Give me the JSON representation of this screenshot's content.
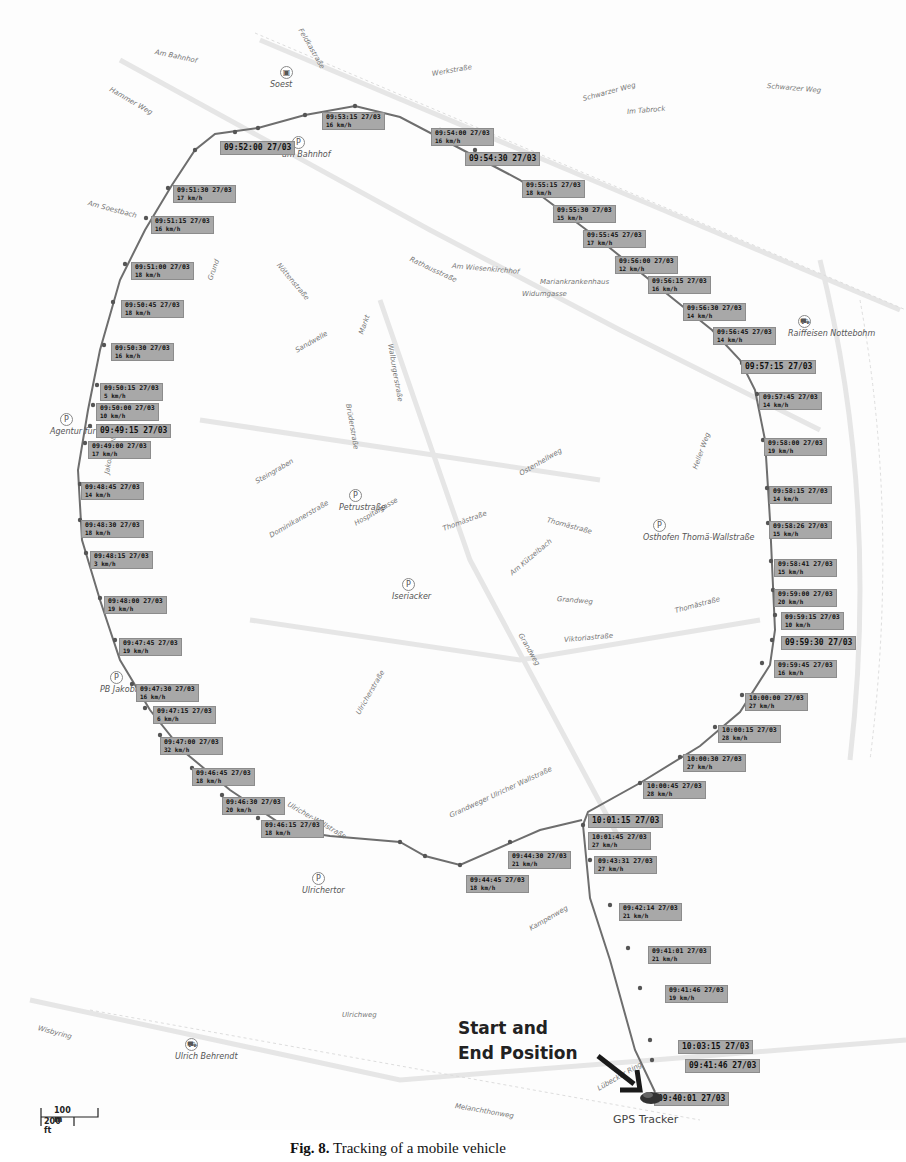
{
  "map": {
    "pois": [
      {
        "name": "Soest",
        "x": 280,
        "y": 80,
        "type": "station"
      },
      {
        "name": "am Bahnhof",
        "x": 292,
        "y": 150,
        "type": "parking"
      },
      {
        "name": "Agentur für Arbeit",
        "x": 60,
        "y": 427,
        "type": "parking"
      },
      {
        "name": "Petrustraße",
        "x": 349,
        "y": 503,
        "type": "parking"
      },
      {
        "name": "Iseriacker",
        "x": 402,
        "y": 592,
        "type": "parking"
      },
      {
        "name": "Raiffeisen Nottebohm",
        "x": 798,
        "y": 329,
        "type": "shop"
      },
      {
        "name": "Osthofen Thomä-Wallstraße",
        "x": 653,
        "y": 533,
        "type": "parking"
      },
      {
        "name": "PB Jakobi",
        "x": 110,
        "y": 685,
        "type": "parking"
      },
      {
        "name": "Ulrichertor",
        "x": 312,
        "y": 886,
        "type": "parking"
      },
      {
        "name": "Ulrich Behrendt",
        "x": 185,
        "y": 1052,
        "type": "shop"
      }
    ],
    "streets": [
      {
        "name": "Am Bahnhof",
        "x": 155,
        "y": 48,
        "r": 12
      },
      {
        "name": "Hammer Weg",
        "x": 110,
        "y": 85,
        "r": 30
      },
      {
        "name": "Feldkastraße",
        "x": 300,
        "y": 25,
        "r": 60
      },
      {
        "name": "Werkstraße",
        "x": 432,
        "y": 70,
        "r": -10
      },
      {
        "name": "Schwarzer Weg",
        "x": 583,
        "y": 95,
        "r": -15
      },
      {
        "name": "Im Tabrock",
        "x": 627,
        "y": 108,
        "r": -5
      },
      {
        "name": "Schwarzer Weg",
        "x": 767,
        "y": 82,
        "r": 5
      },
      {
        "name": "Am Soestbach",
        "x": 88,
        "y": 199,
        "r": 15
      },
      {
        "name": "Grund",
        "x": 210,
        "y": 276,
        "r": -70
      },
      {
        "name": "Nöttenstraße",
        "x": 278,
        "y": 260,
        "r": 50
      },
      {
        "name": "Rathausstraße",
        "x": 410,
        "y": 255,
        "r": 25
      },
      {
        "name": "Am Wiesenkirchhof",
        "x": 452,
        "y": 262,
        "r": 5
      },
      {
        "name": "Mariankrankenhaus",
        "x": 540,
        "y": 278,
        "r": 0
      },
      {
        "name": "Widumgasse",
        "x": 522,
        "y": 290,
        "r": 0
      },
      {
        "name": "Sandwelle",
        "x": 296,
        "y": 347,
        "r": -30
      },
      {
        "name": "Markt",
        "x": 361,
        "y": 330,
        "r": -70
      },
      {
        "name": "Walburgerstraße",
        "x": 390,
        "y": 340,
        "r": 80
      },
      {
        "name": "Brüderstraße",
        "x": 348,
        "y": 400,
        "r": 80
      },
      {
        "name": "Jakobistraße",
        "x": 107,
        "y": 470,
        "r": -80
      },
      {
        "name": "Steingraben",
        "x": 256,
        "y": 478,
        "r": -30
      },
      {
        "name": "Dominikanerstraße",
        "x": 270,
        "y": 532,
        "r": -30
      },
      {
        "name": "Hospitalgasse",
        "x": 355,
        "y": 520,
        "r": -30
      },
      {
        "name": "Thomästraße",
        "x": 443,
        "y": 525,
        "r": -20
      },
      {
        "name": "Thomästraße",
        "x": 547,
        "y": 516,
        "r": 15
      },
      {
        "name": "Ostenhellweg",
        "x": 520,
        "y": 470,
        "r": -30
      },
      {
        "name": "Am Kützelbach",
        "x": 511,
        "y": 570,
        "r": -40
      },
      {
        "name": "Heller Weg",
        "x": 695,
        "y": 465,
        "r": -70
      },
      {
        "name": "Grandweg",
        "x": 557,
        "y": 595,
        "r": 5
      },
      {
        "name": "Grandweg",
        "x": 520,
        "y": 630,
        "r": 60
      },
      {
        "name": "Thomästraße",
        "x": 675,
        "y": 607,
        "r": -15
      },
      {
        "name": "Viktoriastraße",
        "x": 564,
        "y": 636,
        "r": -5
      },
      {
        "name": "Ulricherstraße",
        "x": 358,
        "y": 710,
        "r": -60
      },
      {
        "name": "Ulricher-Wallstraße",
        "x": 288,
        "y": 800,
        "r": 30
      },
      {
        "name": "Grandweger Ulricher Wallstraße",
        "x": 450,
        "y": 812,
        "r": -25
      },
      {
        "name": "Wisbyring",
        "x": 38,
        "y": 1024,
        "r": 15
      },
      {
        "name": "Ulrichweg",
        "x": 342,
        "y": 1011,
        "r": 0
      },
      {
        "name": "Kampenweg",
        "x": 530,
        "y": 925,
        "r": -30
      },
      {
        "name": "Melanchthonweg",
        "x": 455,
        "y": 1102,
        "r": 10
      },
      {
        "name": "Lübecker Ring",
        "x": 598,
        "y": 1085,
        "r": -30
      }
    ],
    "track_labels": [
      {
        "time": "09:53:15 27/03",
        "speed": "16 km/h",
        "x": 322,
        "y": 112
      },
      {
        "time": "09:52:00 27/03",
        "speed": "",
        "x": 220,
        "y": 141
      },
      {
        "time": "09:54:00 27/03",
        "speed": "16 km/h",
        "x": 431,
        "y": 128
      },
      {
        "time": "09:54:30 27/03",
        "speed": "",
        "x": 465,
        "y": 152
      },
      {
        "time": "09:55:15 27/03",
        "speed": "18 km/h",
        "x": 522,
        "y": 180
      },
      {
        "time": "09:55:30 27/03",
        "speed": "15 km/h",
        "x": 553,
        "y": 205
      },
      {
        "time": "09:55:45 27/03",
        "speed": "17 km/h",
        "x": 583,
        "y": 230
      },
      {
        "time": "09:56:00 27/03",
        "speed": "12 km/h",
        "x": 615,
        "y": 256
      },
      {
        "time": "09:56:15 27/03",
        "speed": "16 km/h",
        "x": 648,
        "y": 276
      },
      {
        "time": "09:56:30 27/03",
        "speed": "14 km/h",
        "x": 683,
        "y": 303
      },
      {
        "time": "09:56:45 27/03",
        "speed": "14 km/h",
        "x": 713,
        "y": 327
      },
      {
        "time": "09:57:15 27/03",
        "speed": "",
        "x": 741,
        "y": 360
      },
      {
        "time": "09:57:45 27/03",
        "speed": "14 km/h",
        "x": 759,
        "y": 392
      },
      {
        "time": "09:58:00 27/03",
        "speed": "19 km/h",
        "x": 764,
        "y": 438
      },
      {
        "time": "09:58:15 27/03",
        "speed": "14 km/h",
        "x": 769,
        "y": 486
      },
      {
        "time": "09:58:26 27/03",
        "speed": "15 km/h",
        "x": 769,
        "y": 521
      },
      {
        "time": "09:58:41 27/03",
        "speed": "15 km/h",
        "x": 774,
        "y": 559
      },
      {
        "time": "09:59:00 27/03",
        "speed": "20 km/h",
        "x": 774,
        "y": 589
      },
      {
        "time": "09:59:15 27/03",
        "speed": "10 km/h",
        "x": 781,
        "y": 612
      },
      {
        "time": "09:59:30 27/03",
        "speed": "",
        "x": 781,
        "y": 636
      },
      {
        "time": "09:59:45 27/03",
        "speed": "16 km/h",
        "x": 774,
        "y": 660
      },
      {
        "time": "10:00:00 27/03",
        "speed": "27 km/h",
        "x": 745,
        "y": 693
      },
      {
        "time": "10:00:15 27/03",
        "speed": "28 km/h",
        "x": 718,
        "y": 725
      },
      {
        "time": "10:00:30 27/03",
        "speed": "27 km/h",
        "x": 683,
        "y": 754
      },
      {
        "time": "10:00:45 27/03",
        "speed": "28 km/h",
        "x": 643,
        "y": 781
      },
      {
        "time": "10:01:15 27/03",
        "speed": "",
        "x": 588,
        "y": 814
      },
      {
        "time": "10:01:45 27/03",
        "speed": "27 km/h",
        "x": 588,
        "y": 832
      },
      {
        "time": "09:43:31 27/03",
        "speed": "27 km/h",
        "x": 594,
        "y": 856
      },
      {
        "time": "09:42:14 27/03",
        "speed": "21 km/h",
        "x": 619,
        "y": 903
      },
      {
        "time": "09:41:01 27/03",
        "speed": "21 km/h",
        "x": 648,
        "y": 946
      },
      {
        "time": "09:41:46 27/03",
        "speed": "19 km/h",
        "x": 665,
        "y": 985
      },
      {
        "time": "10:03:15 27/03",
        "speed": "",
        "x": 678,
        "y": 1040
      },
      {
        "time": "09:41:46 27/03",
        "speed": "",
        "x": 685,
        "y": 1059
      },
      {
        "time": "09:40:01 27/03",
        "speed": "",
        "x": 654,
        "y": 1092
      },
      {
        "time": "09:44:30 27/03",
        "speed": "21 km/h",
        "x": 508,
        "y": 851
      },
      {
        "time": "09:44:45 27/03",
        "speed": "18 km/h",
        "x": 466,
        "y": 875
      },
      {
        "time": "09:46:15 27/03",
        "speed": "18 km/h",
        "x": 261,
        "y": 820
      },
      {
        "time": "09:46:30 27/03",
        "speed": "20 km/h",
        "x": 222,
        "y": 797
      },
      {
        "time": "09:46:45 27/03",
        "speed": "18 km/h",
        "x": 192,
        "y": 768
      },
      {
        "time": "09:47:00 27/03",
        "speed": "32 km/h",
        "x": 160,
        "y": 737
      },
      {
        "time": "09:47:15 27/03",
        "speed": "6 km/h",
        "x": 153,
        "y": 706
      },
      {
        "time": "09:47:30 27/03",
        "speed": "16 km/h",
        "x": 136,
        "y": 684
      },
      {
        "time": "09:47:45 27/03",
        "speed": "19 km/h",
        "x": 119,
        "y": 638
      },
      {
        "time": "09:48:00 27/03",
        "speed": "19 km/h",
        "x": 104,
        "y": 596
      },
      {
        "time": "09:48:15 27/03",
        "speed": "3 km/h",
        "x": 90,
        "y": 551
      },
      {
        "time": "09:48:30 27/03",
        "speed": "18 km/h",
        "x": 81,
        "y": 520
      },
      {
        "time": "09:48:45 27/03",
        "speed": "14 km/h",
        "x": 81,
        "y": 482
      },
      {
        "time": "09:49:00 27/03",
        "speed": "17 km/h",
        "x": 88,
        "y": 441
      },
      {
        "time": "09:49:15 27/03",
        "speed": "",
        "x": 96,
        "y": 424
      },
      {
        "time": "09:50:00 27/03",
        "speed": "10 km/h",
        "x": 96,
        "y": 403
      },
      {
        "time": "09:50:15 27/03",
        "speed": "5 km/h",
        "x": 100,
        "y": 383
      },
      {
        "time": "09:50:30 27/03",
        "speed": "16 km/h",
        "x": 111,
        "y": 343
      },
      {
        "time": "09:50:45 27/03",
        "speed": "18 km/h",
        "x": 121,
        "y": 300
      },
      {
        "time": "09:51:00 27/03",
        "speed": "18 km/h",
        "x": 131,
        "y": 262
      },
      {
        "time": "09:51:15 27/03",
        "speed": "16 km/h",
        "x": 151,
        "y": 216
      },
      {
        "time": "09:51:30 27/03",
        "speed": "17 km/h",
        "x": 173,
        "y": 185
      }
    ],
    "annotation": {
      "line1": "Start and",
      "line2": "End Position"
    },
    "tracker_label": "GPS Tracker",
    "scale": {
      "metric": "100 m",
      "imperial": "200 ft"
    }
  },
  "caption": {
    "prefix": "Fig. 8.",
    "text": "Tracking of a mobile vehicle"
  }
}
